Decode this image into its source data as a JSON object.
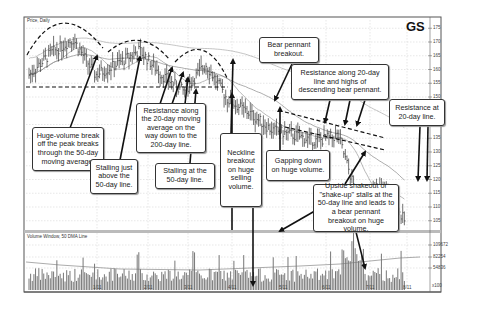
{
  "chart_data": {
    "type": "bar",
    "subtype": "annotated-stock-price-chart-ohlc-with-volume",
    "title": "GS",
    "panels": [
      {
        "name": "price",
        "label": "Price, Daily",
        "y_ticks": [
          105,
          110,
          115,
          120,
          125,
          130,
          135,
          140,
          145,
          150,
          155,
          160,
          165,
          170,
          175
        ],
        "ylim": [
          102,
          178
        ],
        "moving_averages": [
          "20-day",
          "50-day",
          "200-day"
        ]
      },
      {
        "name": "volume",
        "label": "Volume Window, 50 DMA Line",
        "y_ticks": [
          "54836",
          "82254",
          "109672"
        ],
        "y_multiplier": "x100"
      }
    ],
    "x_ticks": [
      "1/11",
      "2/11",
      "3/11",
      "4/11",
      "5/11",
      "6/11",
      "7/11",
      "8/11"
    ],
    "price_path_approx": [
      {
        "x": "Dec",
        "close": 158
      },
      {
        "x": "1/11",
        "close": 166
      },
      {
        "x": "mid-Jan",
        "close": 171
      },
      {
        "x": "late-Jan",
        "close": 158
      },
      {
        "x": "2/11",
        "close": 162
      },
      {
        "x": "mid-Feb",
        "close": 167
      },
      {
        "x": "3/11",
        "close": 158
      },
      {
        "x": "mid-Mar",
        "close": 152
      },
      {
        "x": "4/11",
        "close": 162
      },
      {
        "x": "mid-Apr",
        "close": 149
      },
      {
        "x": "5/11",
        "close": 144
      },
      {
        "x": "mid-May",
        "close": 138
      },
      {
        "x": "6/11",
        "close": 136
      },
      {
        "x": "7/11",
        "close": 134
      },
      {
        "x": "late-Jul",
        "close": 136
      },
      {
        "x": "8/11",
        "close": 110
      },
      {
        "x": "mid-Aug",
        "close": 118
      },
      {
        "x": "end",
        "close": 105
      }
    ],
    "annotations": [
      "Huge-volume break off the peak breaks through the 50-day moving average.",
      "Stalling just above the 50-day line.",
      "Resistance along the 20-day moving average on the way down to the 200-day line.",
      "Stalling at the 50-day line.",
      "Neckline breakout on huge selling volume.",
      "Bear pennant breakout.",
      "Resistance along 20-day line and highs of descending bear pennant.",
      "Gapping down on huge volume.",
      "Resistance at 20-day line.",
      "Upside shakeout or \"shake-up\" stalls at the 50-day line and leads to a bear pennant breakout on huge volume."
    ],
    "grid": true
  },
  "header": {
    "ticker": "GS",
    "price_panel_label": "Price, Daily",
    "volume_panel_label": "Volume Window, 50 DMA Line"
  },
  "price_axis": [
    "175",
    "170",
    "165",
    "160",
    "155",
    "150",
    "145",
    "140",
    "135",
    "130",
    "125",
    "120",
    "115",
    "110",
    "105"
  ],
  "volume_axis": [
    "109672",
    "82254",
    "54836"
  ],
  "volume_multiplier": "x100",
  "x_axis": [
    "1/11",
    "2/11",
    "3/11",
    "4/11",
    "5/11",
    "6/11",
    "7/11",
    "8/11"
  ],
  "callouts": {
    "huge_volume": "Huge-volume break off the peak breaks through the 50-day moving average.",
    "stalling_just_above": "Stalling just above the 50-day line.",
    "resistance_20day_200": "Resistance along the 20-day moving average on the way down to the 200-day line.",
    "stalling_at_50": "Stalling at the 50-day line.",
    "neckline": "Neckline breakout on huge selling volume.",
    "bear_pennant": "Bear pennant breakout.",
    "resistance_pennant": "Resistance along 20-day line and highs of descending bear pennant.",
    "gapping_down": "Gapping down on huge volume.",
    "resistance_20day": "Resistance at 20-day line.",
    "upside_shakeout": "Upside shakeout or \"shake-up\" stalls at the 50-day line and leads to a bear pennant breakout on huge volume."
  }
}
